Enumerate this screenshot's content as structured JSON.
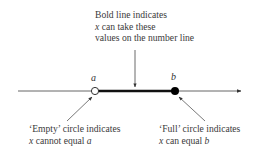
{
  "diagram": {
    "type": "number-line-inequality",
    "colors": {
      "line": "#555555",
      "bold_segment": "#111111",
      "text": "#3a3a3a",
      "empty_circle_fill": "#ffffff",
      "full_circle_fill": "#000000"
    },
    "points": {
      "a": {
        "label": "a",
        "circle": "empty"
      },
      "b": {
        "label": "b",
        "circle": "full"
      }
    },
    "annotations": {
      "top": {
        "line1": "Bold line indicates",
        "line2_var": "x",
        "line2_rest": " can take these",
        "line3": "values on the number line"
      },
      "empty": {
        "line1": "‘Empty’ circle indicates",
        "line2_var": "x",
        "line2_mid": " cannot equal ",
        "line2_end": "a"
      },
      "full": {
        "line1": "‘Full’ circle indicates",
        "line2_var": "x",
        "line2_mid": " can equal ",
        "line2_end": "b"
      }
    }
  }
}
